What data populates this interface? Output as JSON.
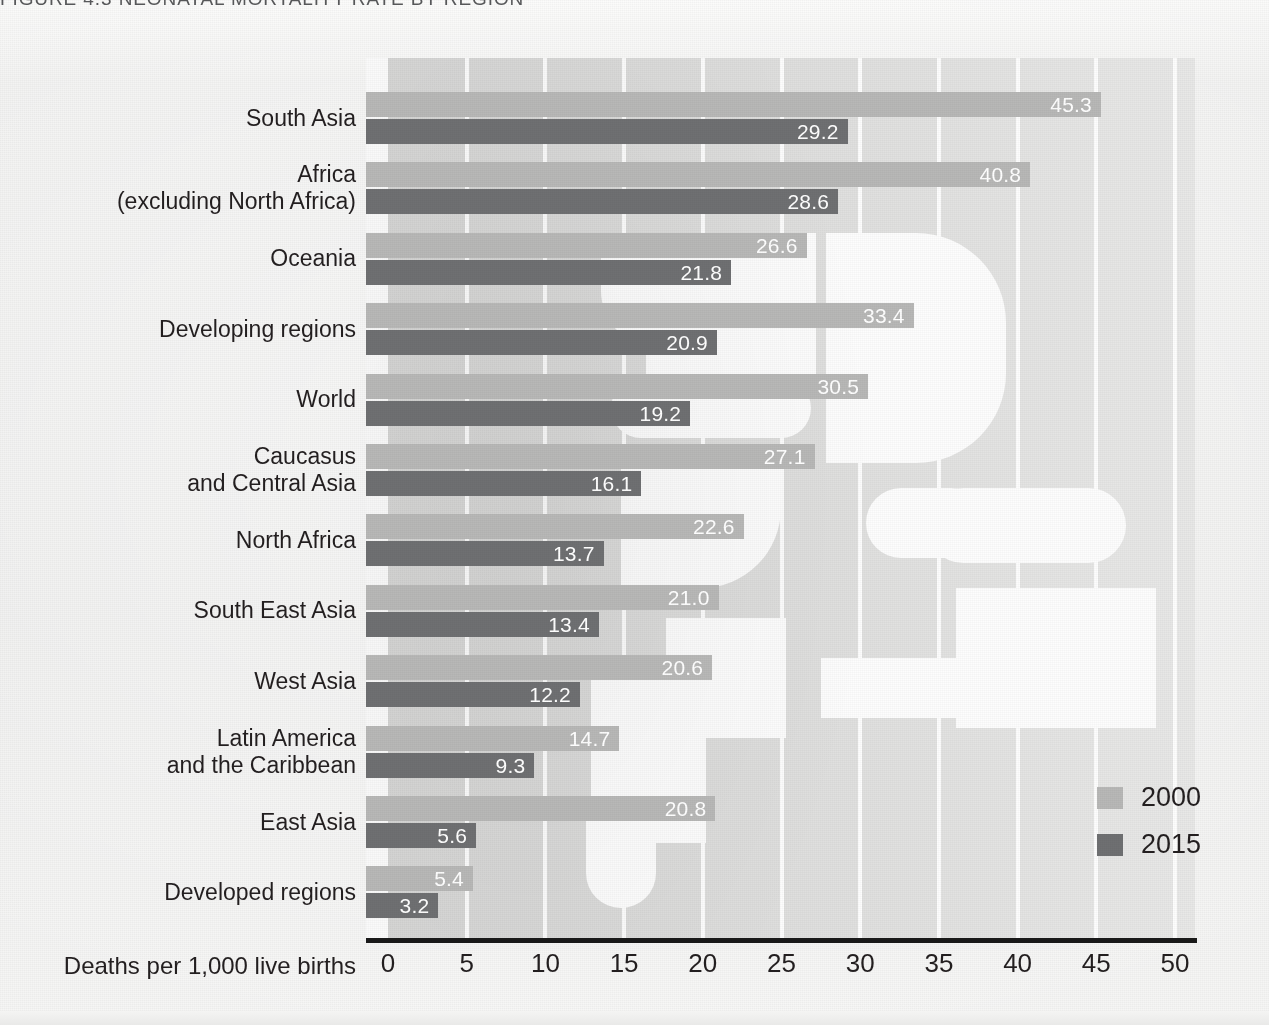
{
  "title": "FIGURE 4.3  NEONATAL MORTALITY RATE BY REGION",
  "axis": {
    "xlabel": "Deaths per 1,000 live births",
    "ticks": [
      "0",
      "5",
      "10",
      "15",
      "20",
      "25",
      "30",
      "35",
      "40",
      "45",
      "50"
    ]
  },
  "legend": {
    "items": [
      {
        "label": "2000",
        "color": "#b8b8b7"
      },
      {
        "label": "2015",
        "color": "#6f7072"
      }
    ]
  },
  "categories": [
    {
      "lines": [
        "South Asia"
      ]
    },
    {
      "lines": [
        "Africa",
        "(excluding North Africa)"
      ]
    },
    {
      "lines": [
        "Oceania"
      ]
    },
    {
      "lines": [
        "Developing regions"
      ]
    },
    {
      "lines": [
        "World"
      ]
    },
    {
      "lines": [
        "Caucasus",
        "and Central Asia"
      ]
    },
    {
      "lines": [
        "North Africa"
      ]
    },
    {
      "lines": [
        "South East Asia"
      ]
    },
    {
      "lines": [
        "West Asia"
      ]
    },
    {
      "lines": [
        "Latin America",
        "and the Caribbean"
      ],
      "bold_first": true
    },
    {
      "lines": [
        "East Asia"
      ]
    },
    {
      "lines": [
        "Developed regions"
      ]
    }
  ],
  "chart_data": {
    "type": "bar",
    "orientation": "horizontal",
    "title": "FIGURE 4.3  NEONATAL MORTALITY RATE BY REGION",
    "xlabel": "Deaths per 1,000 live births",
    "ylabel": "",
    "xlim": [
      0,
      50
    ],
    "xticks": [
      0,
      5,
      10,
      15,
      20,
      25,
      30,
      35,
      40,
      45,
      50
    ],
    "grid": "vertical-white",
    "legend_position": "bottom-right",
    "categories": [
      "South Asia",
      "Africa (excluding North Africa)",
      "Oceania",
      "Developing regions",
      "World",
      "Caucasus and Central Asia",
      "North Africa",
      "South East Asia",
      "West Asia",
      "Latin America and the Caribbean",
      "East Asia",
      "Developed regions"
    ],
    "series": [
      {
        "name": "2000",
        "color": "#b8b8b7",
        "values": [
          45.3,
          40.8,
          26.6,
          33.4,
          30.5,
          27.1,
          22.6,
          21.0,
          20.6,
          14.7,
          20.8,
          5.4
        ]
      },
      {
        "name": "2015",
        "color": "#6f7072",
        "values": [
          29.2,
          28.6,
          21.8,
          20.9,
          19.2,
          16.1,
          13.7,
          13.4,
          12.2,
          9.3,
          5.6,
          3.2
        ]
      }
    ],
    "labels": {
      "2000": [
        "45.3",
        "40.8",
        "26.6",
        "33.4",
        "30.5",
        "27.1",
        "22.6",
        "21.0",
        "20.6",
        "14.7",
        "20.8",
        "5.4"
      ],
      "2015": [
        "29.2",
        "28.6",
        "21.8",
        "20.9",
        "19.2",
        "16.1",
        "13.7",
        "13.4",
        "12.2",
        "9.3",
        "5.6",
        "3.2"
      ]
    }
  }
}
